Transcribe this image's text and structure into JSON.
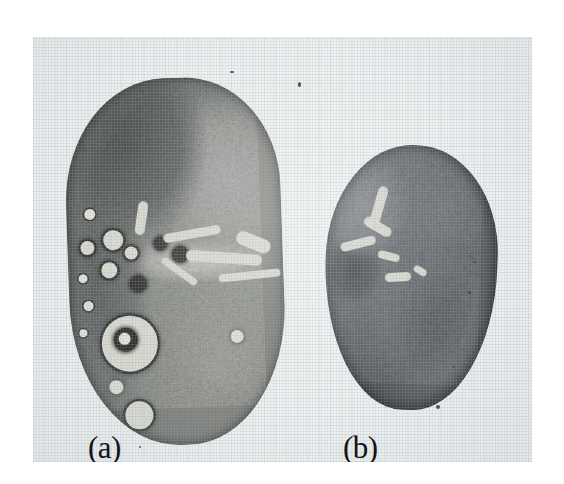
{
  "figure": {
    "type": "scanned-photographic-plate",
    "background_color": "#ffffff",
    "plate_color": "#eef1f1"
  },
  "panels": [
    {
      "id": "a",
      "label": "(a)",
      "caption_position": "bottom-left",
      "specimen": {
        "name": "ovary-section-with-follicles",
        "shape": "elongated lobulated oval",
        "appearance": "dark granular stroma with numerous round follicles and cysts along the left cortical margin; pale hilar streak across the mid region separating an upper and a lower lobe",
        "tone": "#6a6c6a",
        "follicle_count_visible": 17
      }
    },
    {
      "id": "b",
      "label": "(b)",
      "caption_position": "bottom-left",
      "specimen": {
        "name": "ovary-section-smooth",
        "shape": "smooth ovoid / egg shaped",
        "appearance": "uniformly dark granular tissue with a pale branching connective-tissue streak in the upper-left quadrant and a dark focus on the left border; no visible follicles",
        "tone": "#55575a",
        "follicle_count_visible": 0
      }
    }
  ],
  "specimen_a_follicles": [
    {
      "x": 18,
      "y": 128,
      "d": 11,
      "style": "fol-small-pale"
    },
    {
      "x": 13,
      "y": 160,
      "d": 14,
      "style": "fol-ring"
    },
    {
      "x": 36,
      "y": 150,
      "d": 20,
      "style": "fol-ring"
    },
    {
      "x": 10,
      "y": 193,
      "d": 9,
      "style": "fol-small-pale"
    },
    {
      "x": 33,
      "y": 182,
      "d": 16,
      "style": "fol-ring"
    },
    {
      "x": 57,
      "y": 167,
      "d": 13,
      "style": "fol-ring"
    },
    {
      "x": 61,
      "y": 196,
      "d": 17,
      "style": "fol-solid-dark"
    },
    {
      "x": 14,
      "y": 220,
      "d": 10,
      "style": "fol-small-pale"
    },
    {
      "x": 9,
      "y": 248,
      "d": 8,
      "style": "fol-small-pale"
    },
    {
      "x": 31,
      "y": 236,
      "d": 56,
      "style": "fol-ring"
    },
    {
      "x": 43,
      "y": 248,
      "d": 24,
      "style": "fol-solid-dark"
    },
    {
      "x": 48,
      "y": 253,
      "d": 12,
      "style": "fol-small-pale"
    },
    {
      "x": 86,
      "y": 158,
      "d": 14,
      "style": "fol-solid-dark"
    },
    {
      "x": 104,
      "y": 168,
      "d": 17,
      "style": "fol-solid-dark"
    },
    {
      "x": 37,
      "y": 300,
      "d": 14,
      "style": "fol-pale-blob"
    },
    {
      "x": 52,
      "y": 322,
      "d": 28,
      "style": "fol-ring"
    },
    {
      "x": 160,
      "y": 254,
      "d": 13,
      "style": "fol-pale-blob"
    }
  ],
  "specimen_a_streaks": [
    {
      "x": 96,
      "y": 152,
      "w": 58,
      "h": 9,
      "r": -8
    },
    {
      "x": 118,
      "y": 176,
      "w": 76,
      "h": 11,
      "r": 6
    },
    {
      "x": 90,
      "y": 190,
      "w": 42,
      "h": 7,
      "r": 38
    },
    {
      "x": 150,
      "y": 196,
      "w": 62,
      "h": 8,
      "r": -4
    },
    {
      "x": 168,
      "y": 160,
      "w": 36,
      "h": 14,
      "r": 24
    },
    {
      "x": 70,
      "y": 122,
      "w": 10,
      "h": 34,
      "r": 10
    }
  ],
  "specimen_b_streaks": [
    {
      "x": 46,
      "y": 42,
      "w": 10,
      "h": 44,
      "r": 14
    },
    {
      "x": 36,
      "y": 78,
      "w": 30,
      "h": 10,
      "r": 28
    },
    {
      "x": 14,
      "y": 96,
      "w": 36,
      "h": 9,
      "r": -16
    },
    {
      "x": 52,
      "y": 108,
      "w": 22,
      "h": 8,
      "r": 12
    },
    {
      "x": 60,
      "y": 128,
      "w": 26,
      "h": 9,
      "r": -6
    },
    {
      "x": 88,
      "y": 122,
      "w": 14,
      "h": 7,
      "r": 30
    }
  ],
  "specks": [
    {
      "x": 265,
      "y": 45,
      "w": 3,
      "h": 5
    },
    {
      "x": 197,
      "y": 34,
      "w": 4,
      "h": 2
    },
    {
      "x": 403,
      "y": 368,
      "w": 4,
      "h": 4
    },
    {
      "x": 435,
      "y": 254,
      "w": 3,
      "h": 3
    },
    {
      "x": 441,
      "y": 224,
      "w": 2,
      "h": 2
    },
    {
      "x": 420,
      "y": 329,
      "w": 2,
      "h": 2
    },
    {
      "x": 106,
      "y": 409,
      "w": 2,
      "h": 2
    }
  ]
}
